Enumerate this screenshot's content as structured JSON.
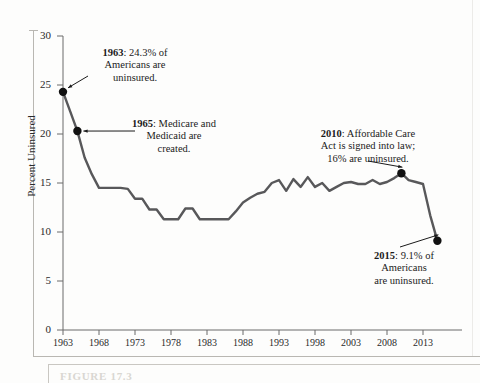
{
  "figure": {
    "caption": "FIGURE 17.3"
  },
  "chart_data": {
    "type": "line",
    "title": "",
    "xlabel": "",
    "ylabel": "Percent Uninsured",
    "xlim": [
      1963,
      2016
    ],
    "ylim": [
      0,
      30
    ],
    "ytick_labels": [
      "0",
      "5",
      "10",
      "15",
      "20",
      "25",
      "30"
    ],
    "ytick_values": [
      0,
      5,
      10,
      15,
      20,
      25,
      30
    ],
    "xtick_labels": [
      "1963",
      "1968",
      "1973",
      "1978",
      "1983",
      "1988",
      "1993",
      "1998",
      "2003",
      "2008",
      "2013"
    ],
    "xtick_values": [
      1963,
      1968,
      1973,
      1978,
      1983,
      1988,
      1993,
      1998,
      2003,
      2008,
      2013
    ],
    "grid": false,
    "legend": "none",
    "line_color": "#58585a",
    "marker_color": "#111111",
    "x": [
      1963,
      1964,
      1965,
      1966,
      1967,
      1968,
      1969,
      1970,
      1971,
      1972,
      1973,
      1974,
      1975,
      1976,
      1977,
      1978,
      1979,
      1980,
      1981,
      1982,
      1983,
      1984,
      1985,
      1986,
      1987,
      1988,
      1989,
      1990,
      1991,
      1992,
      1993,
      1994,
      1995,
      1996,
      1997,
      1998,
      1999,
      2000,
      2001,
      2002,
      2003,
      2004,
      2005,
      2006,
      2007,
      2008,
      2009,
      2010,
      2011,
      2012,
      2013,
      2014,
      2015
    ],
    "values": [
      24.3,
      22.3,
      20.3,
      17.6,
      15.9,
      14.5,
      14.5,
      14.5,
      14.5,
      14.4,
      13.4,
      13.4,
      12.3,
      12.3,
      11.3,
      11.3,
      11.3,
      12.4,
      12.4,
      11.3,
      11.3,
      11.3,
      11.3,
      11.3,
      12.1,
      13.0,
      13.5,
      13.9,
      14.1,
      15.0,
      15.3,
      14.2,
      15.4,
      14.6,
      15.6,
      14.6,
      15.0,
      14.2,
      14.6,
      15.0,
      15.1,
      14.9,
      14.9,
      15.3,
      14.9,
      15.1,
      15.5,
      16.0,
      15.3,
      15.1,
      14.9,
      11.7,
      9.1
    ],
    "annotated_points": [
      {
        "year": 1963,
        "value": 24.3
      },
      {
        "year": 1965,
        "value": 20.3
      },
      {
        "year": 2010,
        "value": 16.0
      },
      {
        "year": 2015,
        "value": 9.1
      }
    ],
    "annotations": [
      {
        "id": "1963",
        "year_label": "1963",
        "text": ": 24.3% of Americans are uninsured.",
        "line1_bold": "1963",
        "line1_rest": ": 24.3% of",
        "line2": "Americans are",
        "line3": "uninsured."
      },
      {
        "id": "1965",
        "year_label": "1965",
        "text": ": Medicare and Medicaid are created.",
        "line1_bold": "1965",
        "line1_rest": ": Medicare and",
        "line2": "Medicaid are",
        "line3": "created."
      },
      {
        "id": "2010",
        "year_label": "2010",
        "text": ": Affordable Care Act is signed into law; 16% are uninsured.",
        "line1_bold": "2010",
        "line1_rest": ": Affordable Care",
        "line2": "Act is signed into law;",
        "line3": "16% are uninsured."
      },
      {
        "id": "2015",
        "year_label": "2015",
        "text": ": 9.1% of Americans are uninsured.",
        "line1_bold": "2015",
        "line1_rest": ": 9.1% of",
        "line2": "Americans",
        "line3": "are uninsured."
      }
    ]
  }
}
